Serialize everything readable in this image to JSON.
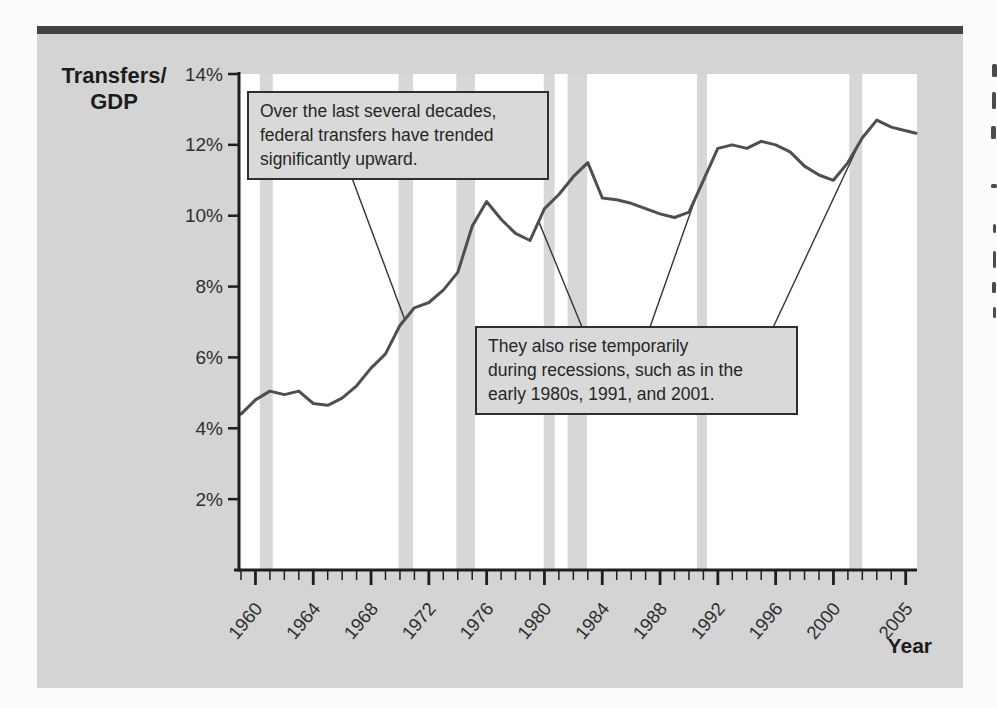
{
  "page": {
    "background_color": "#fcfcfb",
    "figure_background_color": "#d4d4d4",
    "top_rule_color": "#424242"
  },
  "chart_data": {
    "type": "line",
    "title": "",
    "ylabel_lines": [
      "Transfers/",
      "GDP"
    ],
    "xlabel": "Year",
    "ylim": [
      0,
      14
    ],
    "yticks": [
      2,
      4,
      6,
      8,
      10,
      12,
      14
    ],
    "ytick_labels": [
      "2%",
      "4%",
      "6%",
      "8%",
      "10%",
      "12%",
      "14%"
    ],
    "xtick_labeled_years": [
      1960,
      1964,
      1968,
      1972,
      1976,
      1980,
      1984,
      1988,
      1992,
      1996,
      2000,
      2005
    ],
    "x_range": [
      1959,
      2005
    ],
    "x": [
      1959,
      1960,
      1961,
      1962,
      1963,
      1964,
      1965,
      1966,
      1967,
      1968,
      1969,
      1970,
      1971,
      1972,
      1973,
      1974,
      1975,
      1976,
      1977,
      1978,
      1979,
      1980,
      1981,
      1982,
      1983,
      1984,
      1985,
      1986,
      1987,
      1988,
      1989,
      1990,
      1991,
      1992,
      1993,
      1994,
      1995,
      1996,
      1997,
      1998,
      1999,
      2000,
      2001,
      2002,
      2003,
      2004,
      2005
    ],
    "values": [
      4.4,
      4.8,
      5.05,
      4.95,
      5.05,
      4.7,
      4.65,
      4.85,
      5.2,
      5.7,
      6.1,
      6.9,
      7.4,
      7.55,
      7.9,
      8.4,
      9.7,
      10.4,
      9.9,
      9.5,
      9.3,
      10.2,
      10.6,
      11.1,
      11.5,
      10.5,
      10.45,
      10.35,
      10.2,
      10.05,
      9.95,
      10.1,
      11.0,
      11.9,
      12.0,
      11.9,
      12.1,
      12.0,
      11.8,
      11.4,
      11.15,
      11.0,
      11.5,
      12.2,
      12.7,
      12.5,
      12.4
    ],
    "grid": false,
    "legend": "none",
    "plot_background": "#ffffff",
    "line_color": "#4f4f4f",
    "axis_color": "#1e1e1e",
    "tick_label_color": "#2e2e2e",
    "band_color": "#d7d7d7",
    "recession_bands": [
      [
        1960.3,
        1961.2
      ],
      [
        1969.9,
        1970.9
      ],
      [
        1973.9,
        1975.2
      ],
      [
        1979.95,
        1980.7
      ],
      [
        1981.6,
        1982.95
      ],
      [
        1990.55,
        1991.25
      ],
      [
        2001.1,
        2002.0
      ]
    ],
    "annotations": [
      {
        "id": "trend-note",
        "lines": [
          "Over the last several decades,",
          "federal transfers have trended",
          "significantly upward."
        ],
        "leaders": [
          {
            "year": 1970.35,
            "value": 7.05
          }
        ]
      },
      {
        "id": "recessions-note",
        "lines": [
          "They also rise temporarily",
          "during recessions, such as in the",
          "early 1980s, 1991, and 2001."
        ],
        "leaders": [
          {
            "year": 1979.6,
            "value": 9.84
          },
          {
            "year": 1990.5,
            "value": 10.55
          },
          {
            "year": 2001.8,
            "value": 12.06
          }
        ]
      }
    ]
  }
}
